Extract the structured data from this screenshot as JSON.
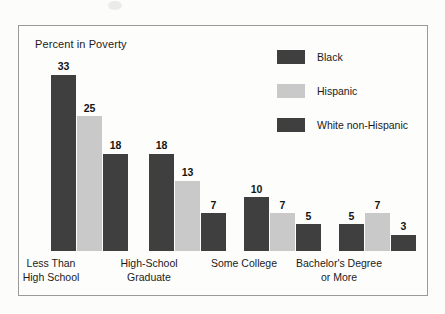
{
  "chart_data": {
    "type": "bar",
    "title": "Percent in Poverty",
    "xlabel": "",
    "ylabel": "",
    "ylim": [
      0,
      35
    ],
    "grid": false,
    "legend_position": "top-right",
    "categories": [
      "Less Than\nHigh School",
      "High-School\nGraduate",
      "Some College",
      "Bachelor's Degree\nor More"
    ],
    "category_lines": [
      [
        "Less Than",
        "High School"
      ],
      [
        "High-School",
        "Graduate"
      ],
      [
        "Some College"
      ],
      [
        "Bachelor's Degree",
        "or More"
      ]
    ],
    "series": [
      {
        "name": "Black",
        "color": "#3f3f3f",
        "values": [
          33,
          18,
          10,
          5
        ]
      },
      {
        "name": "Hispanic",
        "color": "#c9c9c9",
        "values": [
          25,
          13,
          7,
          7
        ]
      },
      {
        "name": "White non-Hispanic",
        "color": "#3f3f3f",
        "values": [
          18,
          7,
          5,
          3
        ]
      }
    ]
  },
  "chart": {
    "title": "Percent in Poverty",
    "frame_color": "#9a9a9a",
    "background": "#fdfdfc",
    "value_label_color": "#141414",
    "pixels_per_unit": 5.4
  },
  "legend": {
    "items": [
      {
        "label": "Black",
        "color": "#3f3f3f"
      },
      {
        "label": "Hispanic",
        "color": "#c9c9c9"
      },
      {
        "label": "White non-Hispanic",
        "color": "#3f3f3f"
      }
    ]
  },
  "groups": [
    {
      "label_line1": "Less Than",
      "label_line2": "High School",
      "left": 32,
      "bars": [
        {
          "series": "Black",
          "value": 33,
          "value_text": "33",
          "color": "#3f3f3f"
        },
        {
          "series": "Hispanic",
          "value": 25,
          "value_text": "25",
          "color": "#c9c9c9"
        },
        {
          "series": "White non-Hispanic",
          "value": 18,
          "value_text": "18",
          "color": "#3f3f3f"
        }
      ]
    },
    {
      "label_line1": "High-School",
      "label_line2": "Graduate",
      "left": 130,
      "bars": [
        {
          "series": "Black",
          "value": 18,
          "value_text": "18",
          "color": "#3f3f3f"
        },
        {
          "series": "Hispanic",
          "value": 13,
          "value_text": "13",
          "color": "#c9c9c9"
        },
        {
          "series": "White non-Hispanic",
          "value": 7,
          "value_text": "7",
          "color": "#3f3f3f"
        }
      ]
    },
    {
      "label_line1": "Some College",
      "label_line2": "",
      "left": 225,
      "bars": [
        {
          "series": "Black",
          "value": 10,
          "value_text": "10",
          "color": "#3f3f3f"
        },
        {
          "series": "Hispanic",
          "value": 7,
          "value_text": "7",
          "color": "#c9c9c9"
        },
        {
          "series": "White non-Hispanic",
          "value": 5,
          "value_text": "5",
          "color": "#3f3f3f"
        }
      ]
    },
    {
      "label_line1": "Bachelor's Degree",
      "label_line2": "or More",
      "left": 320,
      "bars": [
        {
          "series": "Black",
          "value": 5,
          "value_text": "5",
          "color": "#3f3f3f"
        },
        {
          "series": "Hispanic",
          "value": 7,
          "value_text": "7",
          "color": "#c9c9c9"
        },
        {
          "series": "White non-Hispanic",
          "value": 3,
          "value_text": "3",
          "color": "#3f3f3f"
        }
      ]
    }
  ]
}
